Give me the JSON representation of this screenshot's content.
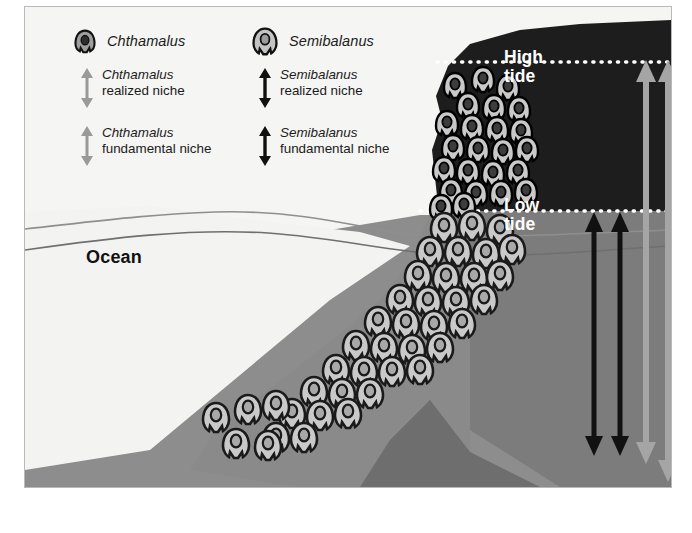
{
  "figure": {
    "type": "ecology-zonation-diagram",
    "background_color": "#fafafa",
    "frame_color": "#b9b9b9"
  },
  "legend": {
    "species": [
      {
        "key": "chthamalus",
        "name": "Chthamalus",
        "icon": "barnacle-dark-icon",
        "color": "#3a3a3a",
        "arrow_color": "#9a9a9a",
        "entries": [
          {
            "italic": "Chthamalus",
            "plain": "realized niche",
            "arrow": "arrow-double-gray-icon"
          },
          {
            "italic": "Chthamalus",
            "plain": "fundamental niche",
            "arrow": "arrow-double-gray-icon"
          }
        ]
      },
      {
        "key": "semibalanus",
        "name": "Semibalanus",
        "icon": "barnacle-light-icon",
        "color": "#b4b4b4",
        "arrow_color": "#111111",
        "entries": [
          {
            "italic": "Semibalanus",
            "plain": "realized niche",
            "arrow": "arrow-double-black-icon"
          },
          {
            "italic": "Semibalanus",
            "plain": "fundamental niche",
            "arrow": "arrow-double-black-icon"
          }
        ]
      }
    ]
  },
  "scene": {
    "tide_lines": [
      {
        "key": "high",
        "label_line1": "High",
        "label_line2": "tide",
        "color": "#ffffff",
        "style": "dotted",
        "y": 62
      },
      {
        "key": "low",
        "label_line1": "Low",
        "label_line2": "tide",
        "color": "#ffffff",
        "style": "dotted",
        "y": 211
      }
    ],
    "ocean_label": "Ocean",
    "zones": [
      {
        "key": "sky-rock",
        "description": "dark rock above high tide",
        "color": "#1d1d1d"
      },
      {
        "key": "upper-intertidal-rock",
        "description": "rock between high and low tide",
        "color": "#2b2b2b"
      },
      {
        "key": "subtidal-water",
        "description": "water below low tide",
        "color": "#8d8d8d"
      },
      {
        "key": "shore-pale",
        "description": "pale foreground shore",
        "color": "#f2f2f0"
      },
      {
        "key": "deep-rock",
        "description": "dark rock mass at sea floor",
        "color": "#6e6e6e"
      }
    ],
    "niche_arrows": [
      {
        "key": "semibalanus-realized",
        "color": "#111111",
        "top_y": 216,
        "bottom_y": 452,
        "x": 594,
        "heads": "both"
      },
      {
        "key": "semibalanus-fundamental",
        "color": "#111111",
        "top_y": 216,
        "bottom_y": 452,
        "x": 620,
        "heads": "both"
      },
      {
        "key": "chthamalus-realized",
        "color": "#9a9a9a",
        "top_y": 62,
        "bottom_y": 460,
        "x": 646,
        "heads": "both"
      },
      {
        "key": "chthamalus-fundamental",
        "color": "#9a9a9a",
        "top_y": 62,
        "bottom_y": 478,
        "x": 668,
        "heads": "both"
      }
    ],
    "barnacle_populations": [
      {
        "key": "chthamalus-upper",
        "species": "Chthamalus",
        "shell": "#cfcfcf",
        "outline": "#000000",
        "zone": "high intertidal"
      },
      {
        "key": "semibalanus-lower",
        "species": "Semibalanus",
        "shell": "#c9c9c9",
        "outline": "#1a1a1a",
        "zone": "low intertidal / subtidal"
      }
    ]
  }
}
